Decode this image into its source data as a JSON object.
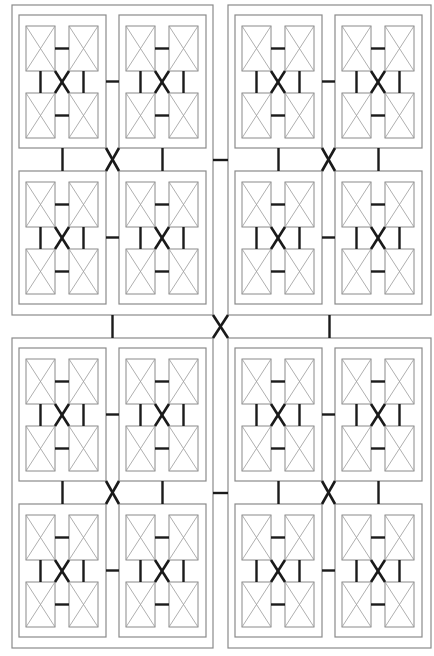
{
  "diagram": {
    "type": "recursive-hierarchical-block-diagram",
    "levels": 3,
    "branching": 4,
    "colors": {
      "background": "#ffffff",
      "box_stroke": "#8a8a8a",
      "cell_cross": "#9a9a9a",
      "connector": "#1a1a1a"
    },
    "outer_blocks": [
      {
        "id": "top-left",
        "x": 12,
        "y": 5,
        "w": 201,
        "h": 310
      },
      {
        "id": "top-right",
        "x": 228,
        "y": 5,
        "w": 203,
        "h": 310
      },
      {
        "id": "bottom-left",
        "x": 12,
        "y": 338,
        "w": 201,
        "h": 310
      },
      {
        "id": "bottom-right",
        "x": 228,
        "y": 338,
        "w": 203,
        "h": 310
      }
    ],
    "mid_block_offsets": [
      {
        "dx": 7,
        "dy": 10
      },
      {
        "dx": 107,
        "dy": 10
      },
      {
        "dx": 7,
        "dy": 166
      },
      {
        "dx": 107,
        "dy": 166
      }
    ],
    "mid_block_size": {
      "w": 87,
      "h": 133
    },
    "leaf_offsets": [
      {
        "dx": 7,
        "dy": 11
      },
      {
        "dx": 50,
        "dy": 11
      },
      {
        "dx": 7,
        "dy": 78
      },
      {
        "dx": 50,
        "dy": 78
      }
    ],
    "leaf_size": {
      "w": 29,
      "h": 45
    }
  },
  "watermark": ""
}
